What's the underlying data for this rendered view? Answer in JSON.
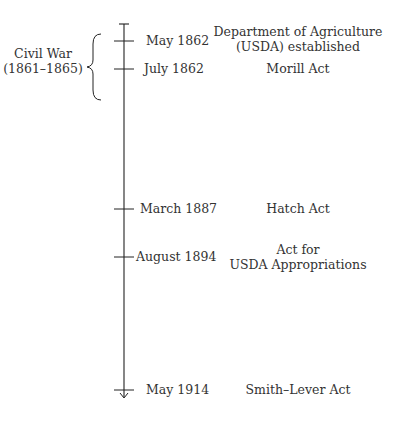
{
  "timeline": {
    "era": {
      "label_line1": "Civil War",
      "label_line2": "(1861–1865)"
    },
    "entries": [
      {
        "date": "May 1862",
        "event_line1": "Department of Agriculture",
        "event_line2": "(USDA) established"
      },
      {
        "date": "July 1862",
        "event_line1": "Morill Act",
        "event_line2": ""
      },
      {
        "date": "March 1887",
        "event_line1": "Hatch Act",
        "event_line2": ""
      },
      {
        "date": "August 1894",
        "event_line1": "Act for",
        "event_line2": "USDA Appropriations"
      },
      {
        "date": "May 1914",
        "event_line1": "Smith–Lever Act",
        "event_line2": ""
      }
    ]
  }
}
